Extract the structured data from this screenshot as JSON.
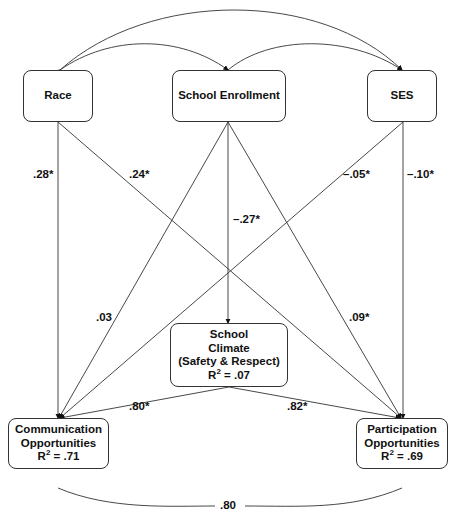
{
  "nodes": {
    "race": {
      "label": "Race"
    },
    "enrollment": {
      "label": "School Enrollment"
    },
    "ses": {
      "label": "SES"
    },
    "climate": {
      "line1": "School",
      "line2": "Climate",
      "line3": "(Safety & Respect)",
      "r2": "R",
      "r2_value": "= .07"
    },
    "communication": {
      "line1": "Communication",
      "line2": "Opportunities",
      "r2": "R",
      "r2_value": "= .71"
    },
    "participation": {
      "line1": "Participation",
      "line2": "Opportunities",
      "r2": "R",
      "r2_value": "= .69"
    }
  },
  "paths": {
    "race_comm": ".28*",
    "race_part": ".24*",
    "enroll_climate": "–.27*",
    "ses_comm": "–.05*",
    "ses_part": "–.10*",
    "enroll_comm": ".03",
    "enroll_part": ".09*",
    "climate_comm": ".80*",
    "climate_part": ".82*",
    "comm_part_cov": ".80"
  },
  "sup2": "2"
}
